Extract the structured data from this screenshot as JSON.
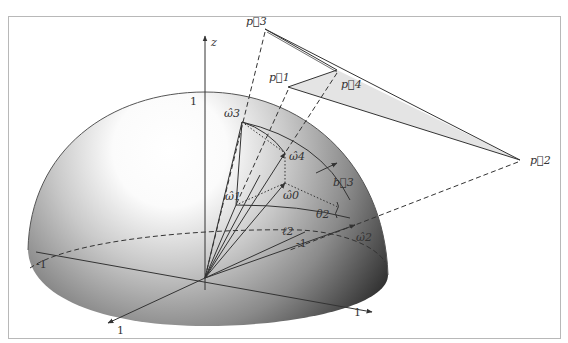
{
  "figure": {
    "axes": {
      "z_label": "z",
      "tick_z_top": "1",
      "tick_x_left": "-1",
      "tick_x_right_back": "-1",
      "tick_front_left": "1",
      "tick_front_right": "1"
    },
    "polygon_points": {
      "p1": "p⃗1",
      "p2": "p⃗2",
      "p3": "p⃗3",
      "p4": "p⃗4"
    },
    "projected_points": {
      "w0": "ω̂0",
      "w1": "ω̂1",
      "w2": "ω̂2",
      "w3": "ω̂3",
      "w4": "ω̂4"
    },
    "annotations": {
      "b3": "b⃗3",
      "theta2": "θ2",
      "ell2": "ℓ2"
    },
    "colors": {
      "frame": "#b8b8b8",
      "ink": "#333333",
      "sphere_light": "#ffffff",
      "sphere_dark": "#2a2a2a",
      "polygon_fill": "#e4e4e4"
    }
  }
}
